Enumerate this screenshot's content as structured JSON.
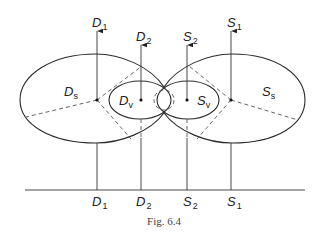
{
  "figure": {
    "caption": "Fig. 6.4",
    "top_labels": [
      {
        "id": "D1",
        "main": "D",
        "sub": "1"
      },
      {
        "id": "D2",
        "main": "D",
        "sub": "2"
      },
      {
        "id": "S2",
        "main": "S",
        "sub": "2"
      },
      {
        "id": "S1",
        "main": "S",
        "sub": "1"
      }
    ],
    "bottom_labels": [
      {
        "id": "D1",
        "main": "D",
        "sub": "1"
      },
      {
        "id": "D2",
        "main": "D",
        "sub": "2"
      },
      {
        "id": "S2",
        "main": "S",
        "sub": "2"
      },
      {
        "id": "S1",
        "main": "S",
        "sub": "1"
      }
    ],
    "regions": {
      "left_outer": {
        "main": "D",
        "sub": "s"
      },
      "left_inner": {
        "main": "D",
        "sub": "v"
      },
      "right_inner": {
        "main": "S",
        "sub": "v"
      },
      "right_outer": {
        "main": "S",
        "sub": "s"
      }
    }
  }
}
